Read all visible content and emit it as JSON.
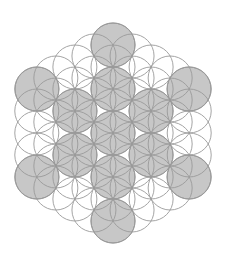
{
  "diagram": {
    "canvas": {
      "width": 228,
      "height": 259,
      "background": "#ffffff"
    },
    "center": {
      "x": 113,
      "y": 133
    },
    "radius": 22,
    "lattice": {
      "type": "hexagonal",
      "spacing": 22,
      "hex_extent": 4,
      "count": 61,
      "stroke": "#9a9a9a"
    },
    "highlighted": {
      "name": "fruit-of-life",
      "fill": "#bdbdbd",
      "stroke": "#8c8c8c",
      "circles": [
        {
          "x": 113,
          "y": 133
        },
        {
          "x": 113,
          "y": 89
        },
        {
          "x": 113,
          "y": 177
        },
        {
          "x": 75,
          "y": 111
        },
        {
          "x": 151,
          "y": 111
        },
        {
          "x": 75,
          "y": 155
        },
        {
          "x": 151,
          "y": 155
        },
        {
          "x": 113,
          "y": 45
        },
        {
          "x": 113,
          "y": 221
        },
        {
          "x": 37,
          "y": 89
        },
        {
          "x": 189,
          "y": 89
        },
        {
          "x": 37,
          "y": 177
        },
        {
          "x": 189,
          "y": 177
        }
      ]
    }
  }
}
